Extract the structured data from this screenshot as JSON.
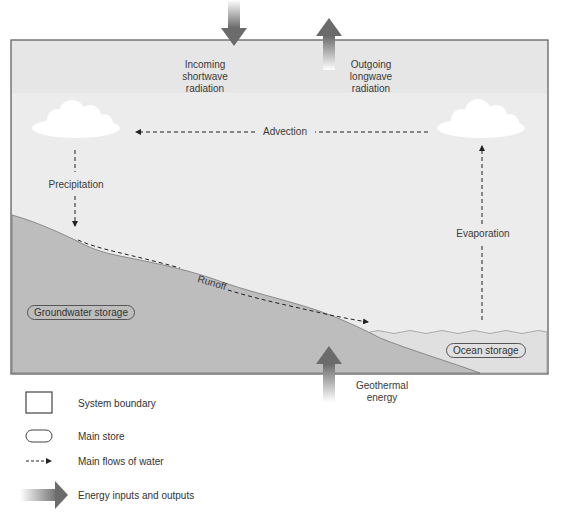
{
  "diagram": {
    "labels": {
      "incoming": "Incoming\nshortwave\nradiation",
      "outgoing": "Outgoing\nlongwave\nradiation",
      "advection": "Advection",
      "precipitation": "Precipitation",
      "evaporation": "Evaporation",
      "runoff": "Runoff",
      "geothermal": "Geothermal\nenergy"
    },
    "stores": {
      "groundwater": "Groundwater storage",
      "ocean": "Ocean storage"
    },
    "colors": {
      "sky": "#ececec",
      "land": "#bdbdbd",
      "ocean": "#e0e0e0",
      "border": "#555555",
      "arrow": "#6b6b6b"
    }
  },
  "legend": {
    "items": [
      {
        "symbol": "rectangle",
        "label": "System boundary"
      },
      {
        "symbol": "rounded-rectangle",
        "label": "Main store"
      },
      {
        "symbol": "dashed-arrow",
        "label": "Main flows of water"
      },
      {
        "symbol": "gradient-arrow",
        "label": "Energy inputs and outputs"
      }
    ]
  }
}
